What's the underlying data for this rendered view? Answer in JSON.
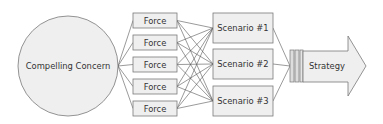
{
  "diagram": {
    "concern": {
      "label": "Compelling Concern",
      "cx": 68,
      "cy": 66,
      "r": 50
    },
    "forces": [
      {
        "label": "Force",
        "x": 133,
        "y": 13,
        "w": 44,
        "h": 15
      },
      {
        "label": "Force",
        "x": 133,
        "y": 35,
        "w": 44,
        "h": 15
      },
      {
        "label": "Force",
        "x": 133,
        "y": 57,
        "w": 44,
        "h": 15
      },
      {
        "label": "Force",
        "x": 133,
        "y": 79,
        "w": 44,
        "h": 15
      },
      {
        "label": "Force",
        "x": 133,
        "y": 101,
        "w": 44,
        "h": 15
      }
    ],
    "scenarios": [
      {
        "label": "Scenario #1",
        "x": 213,
        "y": 13,
        "w": 60,
        "h": 30
      },
      {
        "label": "Scenario #2",
        "x": 213,
        "y": 49,
        "w": 60,
        "h": 30
      },
      {
        "label": "Scenario #3",
        "x": 213,
        "y": 86,
        "w": 60,
        "h": 30
      }
    ],
    "strategy": {
      "label": "Strategy"
    },
    "colors": {
      "fill": "#eeeeee",
      "stroke": "#777777",
      "line": "#444444",
      "text": "#333333"
    }
  }
}
